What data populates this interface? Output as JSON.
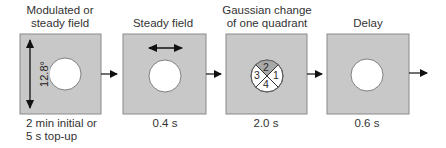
{
  "diagram": {
    "stages": [
      {
        "title_lines": [
          "Modulated or",
          "steady field"
        ],
        "duration_lines": [
          "2 min initial or",
          "5 s top-up"
        ],
        "annotation": "12.8°",
        "indicator": "vertical-double-arrow"
      },
      {
        "title_lines": [
          "Steady field"
        ],
        "duration_lines": [
          "0.4 s"
        ],
        "indicator": "horizontal-double-arrow"
      },
      {
        "title_lines": [
          "Gaussian change",
          "of one quadrant"
        ],
        "duration_lines": [
          "2.0 s"
        ],
        "quadrants": [
          "2",
          "1",
          "4",
          "3"
        ],
        "indicator": "quadrant-circle"
      },
      {
        "title_lines": [
          "Delay"
        ],
        "duration_lines": [
          "0.6 s"
        ],
        "indicator": "none"
      }
    ],
    "colors": {
      "box_fill": "#c8c8c8",
      "box_border": "#8a8a8a",
      "arrow": "#111111",
      "circle_fill": "#ffffff",
      "shaded_quadrant": "#a8a8a8"
    }
  }
}
